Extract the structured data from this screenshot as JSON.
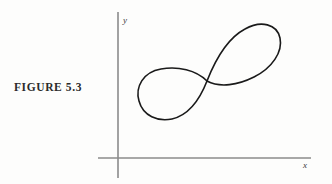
{
  "page": {
    "background_color": "#fdfdfc",
    "width": 332,
    "height": 184
  },
  "figure": {
    "caption": "FIGURE 5.3",
    "caption_color": "#2b2b2b"
  },
  "axes": {
    "color": "#8b8b8b",
    "x_label": "x",
    "y_label": "y",
    "origin": {
      "x": 118,
      "y": 158
    },
    "x_axis": {
      "x1": 98,
      "y1": 158,
      "x2": 311,
      "y2": 158
    },
    "y_axis": {
      "x1": 118,
      "y1": 12,
      "x2": 118,
      "y2": 178
    },
    "x_label_pos": {
      "x": 303,
      "y": 168
    },
    "y_label_pos": {
      "x": 123,
      "y": 23
    }
  },
  "chart_data": {
    "type": "line",
    "title": "FIGURE 5.3",
    "xlabel": "x",
    "ylabel": "y",
    "grid": false,
    "legend": null,
    "curve_color": "#1a1a1a",
    "curve_stroke_width": 1.6,
    "self_intersection": {
      "x": 207,
      "y": 81
    },
    "left_lobe_bounds": {
      "x_min": 140,
      "x_max": 208,
      "y_min": 69,
      "y_max": 120
    },
    "right_lobe_bounds": {
      "x_min": 206,
      "x_max": 282,
      "y_min": 25,
      "y_max": 86
    },
    "path": "M 207 81 C 196 70 178 66 161 69 C 143 72 135 87 139 101 C 143 116 158 122 172 119 C 189 115 200 99 207 81 C 216 58 228 38 245 29 C 261 20 277 24 280 38 C 283 52 272 68 254 77 C 238 85 220 88 207 81 Z",
    "points_note": "Closed curve rendered as cubic Bezier segments in screen pixel coordinates."
  }
}
